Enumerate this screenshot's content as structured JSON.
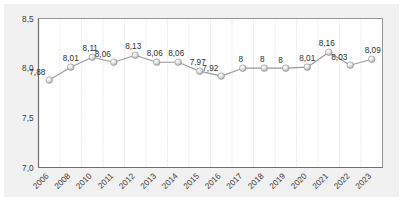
{
  "chart_data": {
    "type": "line",
    "title": "",
    "subtitle": "",
    "xlabel": "",
    "ylabel": "",
    "categories": [
      "2006",
      "2008",
      "2010",
      "2011",
      "2012",
      "2013",
      "2014",
      "2015",
      "2016",
      "2017",
      "2018",
      "2019",
      "2020",
      "2021",
      "2022",
      "2023"
    ],
    "values": [
      7.88,
      8.01,
      8.11,
      8.06,
      8.13,
      8.06,
      8.06,
      7.97,
      7.92,
      8,
      8,
      8,
      8.01,
      8.16,
      8.03,
      8.09
    ],
    "point_labels": [
      "7,88",
      "8,01",
      "8,11",
      "8,06",
      "8,13",
      "8,06",
      "8,06",
      "7,97",
      "7,92",
      "8",
      "8",
      "8",
      "8,01",
      "8,16",
      "8,03",
      "8,09"
    ],
    "ylim": [
      7.0,
      8.5
    ],
    "yticks": [
      7.0,
      7.5,
      8.0,
      8.5
    ],
    "ytick_labels": [
      "7,0",
      "7,5",
      "8,0",
      "8,5"
    ],
    "grid": {
      "vertical": true,
      "horizontal": false
    },
    "legend": {
      "visible": false,
      "position": "none"
    },
    "series": [
      {
        "name": "series-1",
        "values": [
          7.88,
          8.01,
          8.11,
          8.06,
          8.13,
          8.06,
          8.06,
          7.97,
          7.92,
          8,
          8,
          8,
          8.01,
          8.16,
          8.03,
          8.09
        ],
        "line_color": "#9a9a9a",
        "marker": "sphere",
        "marker_color": "#d9d9d9"
      }
    ],
    "colors": {
      "panel_background": "#f1f1f1",
      "plot_background": "#ffffff",
      "axis_line": "#8c8c8c",
      "gridline": "#dcdcdc",
      "text": "#3a3a3a",
      "line": "#9a9a9a",
      "marker_fill": "#e8e8e8",
      "marker_edge": "#8f8f8f"
    },
    "xtick_rotation_deg": -45
  }
}
